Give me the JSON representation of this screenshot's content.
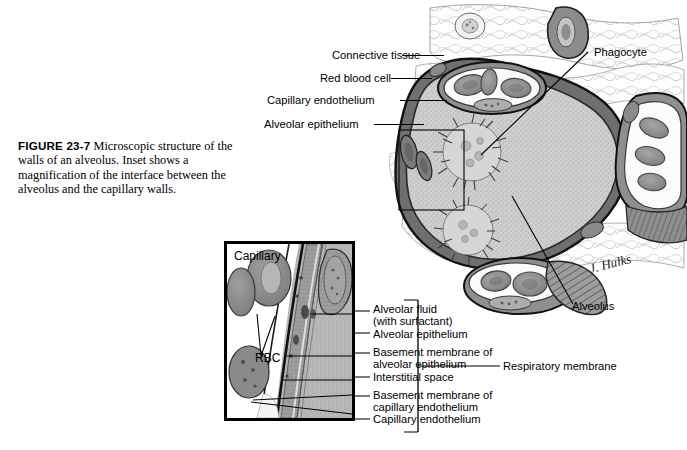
{
  "figure": {
    "number": "FIGURE 23-7",
    "caption": "Microscopic structure of the walls of an alveolus. Inset shows a magnification of the interface between the alveolus and the capillary walls.",
    "signature": "J. Hulks"
  },
  "main_labels": {
    "connective_tissue": "Connective tissue",
    "red_blood_cell": "Red blood cell",
    "capillary_endothelium": "Capillary endothelium",
    "alveolar_epithelium": "Alveolar epithelium",
    "phagocyte": "Phagocyte",
    "alveolus": "Alveolus",
    "respiratory_membrane": "Respiratory membrane"
  },
  "inset_labels": {
    "capillary": "Capillary",
    "rbc": "RBC"
  },
  "membrane_layers": [
    {
      "line1": "Alveolar fluid",
      "line2": "(with surfactant)"
    },
    {
      "line1": "Alveolar epithelium",
      "line2": ""
    },
    {
      "line1": "Basement membrane of",
      "line2": "alveolar epithelium"
    },
    {
      "line1": "Interstitial space",
      "line2": ""
    },
    {
      "line1": "Basement membrane of",
      "line2": "capillary endothelium"
    },
    {
      "line1": "Capillary endothelium",
      "line2": ""
    }
  ],
  "colors": {
    "ink": "#000000",
    "page": "#ffffff",
    "lumen": "#c9c9c9",
    "tissue_mid": "#9a9a9a",
    "tissue_dark": "#6e6e6e",
    "rbc": "#8c8c8c"
  }
}
